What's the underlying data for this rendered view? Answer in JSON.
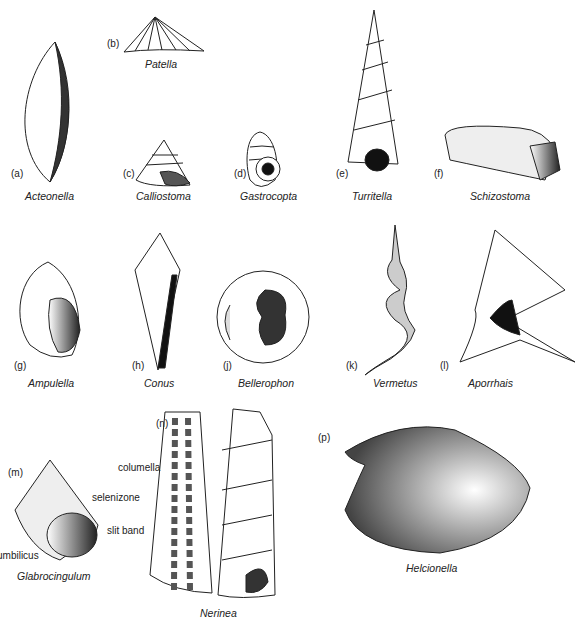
{
  "figure": {
    "specimens": [
      {
        "letter": "(a)",
        "name": "Acteonella"
      },
      {
        "letter": "(b)",
        "name": "Patella"
      },
      {
        "letter": "(c)",
        "name": "Calliostoma"
      },
      {
        "letter": "(d)",
        "name": "Gastrocopta"
      },
      {
        "letter": "(e)",
        "name": "Turritella"
      },
      {
        "letter": "(f)",
        "name": "Schizostoma"
      },
      {
        "letter": "(g)",
        "name": "Ampulella"
      },
      {
        "letter": "(h)",
        "name": "Conus"
      },
      {
        "letter": "(j)",
        "name": "Bellerophon"
      },
      {
        "letter": "(k)",
        "name": "Vermetus"
      },
      {
        "letter": "(l)",
        "name": "Aporrhais"
      },
      {
        "letter": "(m)",
        "name": "Glabrocingulum"
      },
      {
        "letter": "(n)",
        "name": "Nerinea"
      },
      {
        "letter": "(p)",
        "name": "Helcionella"
      }
    ],
    "annotations": {
      "selenizone": "selenizone",
      "slit_band": "slit band",
      "umbilicus": "umbilicus",
      "columella": "columella"
    }
  }
}
